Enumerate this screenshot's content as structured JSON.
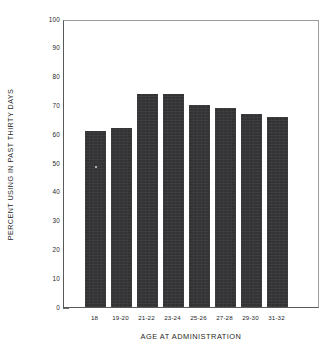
{
  "chart_data": {
    "type": "bar",
    "title": "",
    "xlabel": "AGE AT ADMINISTRATION",
    "ylabel": "PERCENT USING IN PAST THIRTY DAYS",
    "categories": [
      "18",
      "19-20",
      "21-22",
      "23-24",
      "25-26",
      "27-28",
      "29-30",
      "31-32"
    ],
    "values": [
      61,
      62,
      74,
      74,
      70,
      69,
      67,
      66
    ],
    "ylim": [
      0,
      100
    ],
    "ytick_labels": [
      "100",
      "90",
      "80",
      "70",
      "60",
      "50",
      "40",
      "30",
      "20",
      "10",
      "0"
    ],
    "ytick_values": [
      100,
      90,
      80,
      70,
      60,
      50,
      40,
      30,
      20,
      10,
      0
    ],
    "grid": false,
    "legend": null,
    "bar_color": "#333335",
    "axis_color": "#58595b",
    "background_color": "#ffffff"
  }
}
